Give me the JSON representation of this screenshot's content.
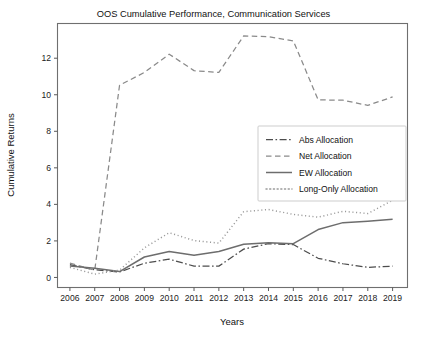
{
  "chart_data": {
    "type": "line",
    "title": "OOS Cumulative Performance, Communication Services",
    "xlabel": "Years",
    "ylabel": "Cumulative Returns",
    "grid": false,
    "legend_position": "center-right",
    "x": [
      2006,
      2007,
      2008,
      2009,
      2010,
      2011,
      2012,
      2013,
      2014,
      2015,
      2016,
      2017,
      2018,
      2019
    ],
    "categories": [
      "2006",
      "2007",
      "2008",
      "2009",
      "2010",
      "2011",
      "2012",
      "2013",
      "2014",
      "2015",
      "2016",
      "2017",
      "2018",
      "2019"
    ],
    "xlim": [
      2005.5,
      2019.6
    ],
    "ylim": [
      -0.55,
      13.9
    ],
    "yticks": [
      0,
      2,
      4,
      6,
      8,
      10,
      12
    ],
    "ytick_labels": [
      "0",
      "2",
      "4",
      "6",
      "8",
      "10",
      "12"
    ],
    "series": [
      {
        "name": "Abs Allocation",
        "style": "dashdot",
        "color": "#4d4d4d",
        "width": 1.25,
        "dash": "7,2.5,1.6,2.5",
        "values": [
          0.7,
          0.42,
          0.3,
          0.78,
          1.0,
          0.62,
          0.62,
          1.55,
          1.85,
          1.8,
          1.05,
          0.75,
          0.55,
          0.62
        ]
      },
      {
        "name": "Net Allocation",
        "style": "dashed",
        "color": "#8a8a8a",
        "width": 1.25,
        "dash": "5.5,3.5",
        "values": [
          0.78,
          0.4,
          10.52,
          11.22,
          12.22,
          11.32,
          11.22,
          13.22,
          13.18,
          12.95,
          9.72,
          9.7,
          9.42,
          9.88
        ]
      },
      {
        "name": "EW Allocation",
        "style": "solid",
        "color": "#6d6d6d",
        "width": 1.5,
        "dash": "none",
        "values": [
          0.62,
          0.5,
          0.32,
          1.12,
          1.42,
          1.22,
          1.42,
          1.82,
          1.9,
          1.85,
          2.62,
          3.0,
          3.08,
          3.18
        ]
      },
      {
        "name": "Long-Only Allocation",
        "style": "dotted",
        "color": "#9a9a9a",
        "width": 1.45,
        "dash": "1.1,2.6",
        "values": [
          0.55,
          0.18,
          0.4,
          1.62,
          2.45,
          2.02,
          1.88,
          3.6,
          3.72,
          3.45,
          3.3,
          3.62,
          3.5,
          4.22
        ]
      }
    ]
  },
  "legend": {
    "items": [
      {
        "label": "Abs Allocation"
      },
      {
        "label": "Net Allocation"
      },
      {
        "label": "EW Allocation"
      },
      {
        "label": "Long-Only Allocation"
      }
    ]
  }
}
